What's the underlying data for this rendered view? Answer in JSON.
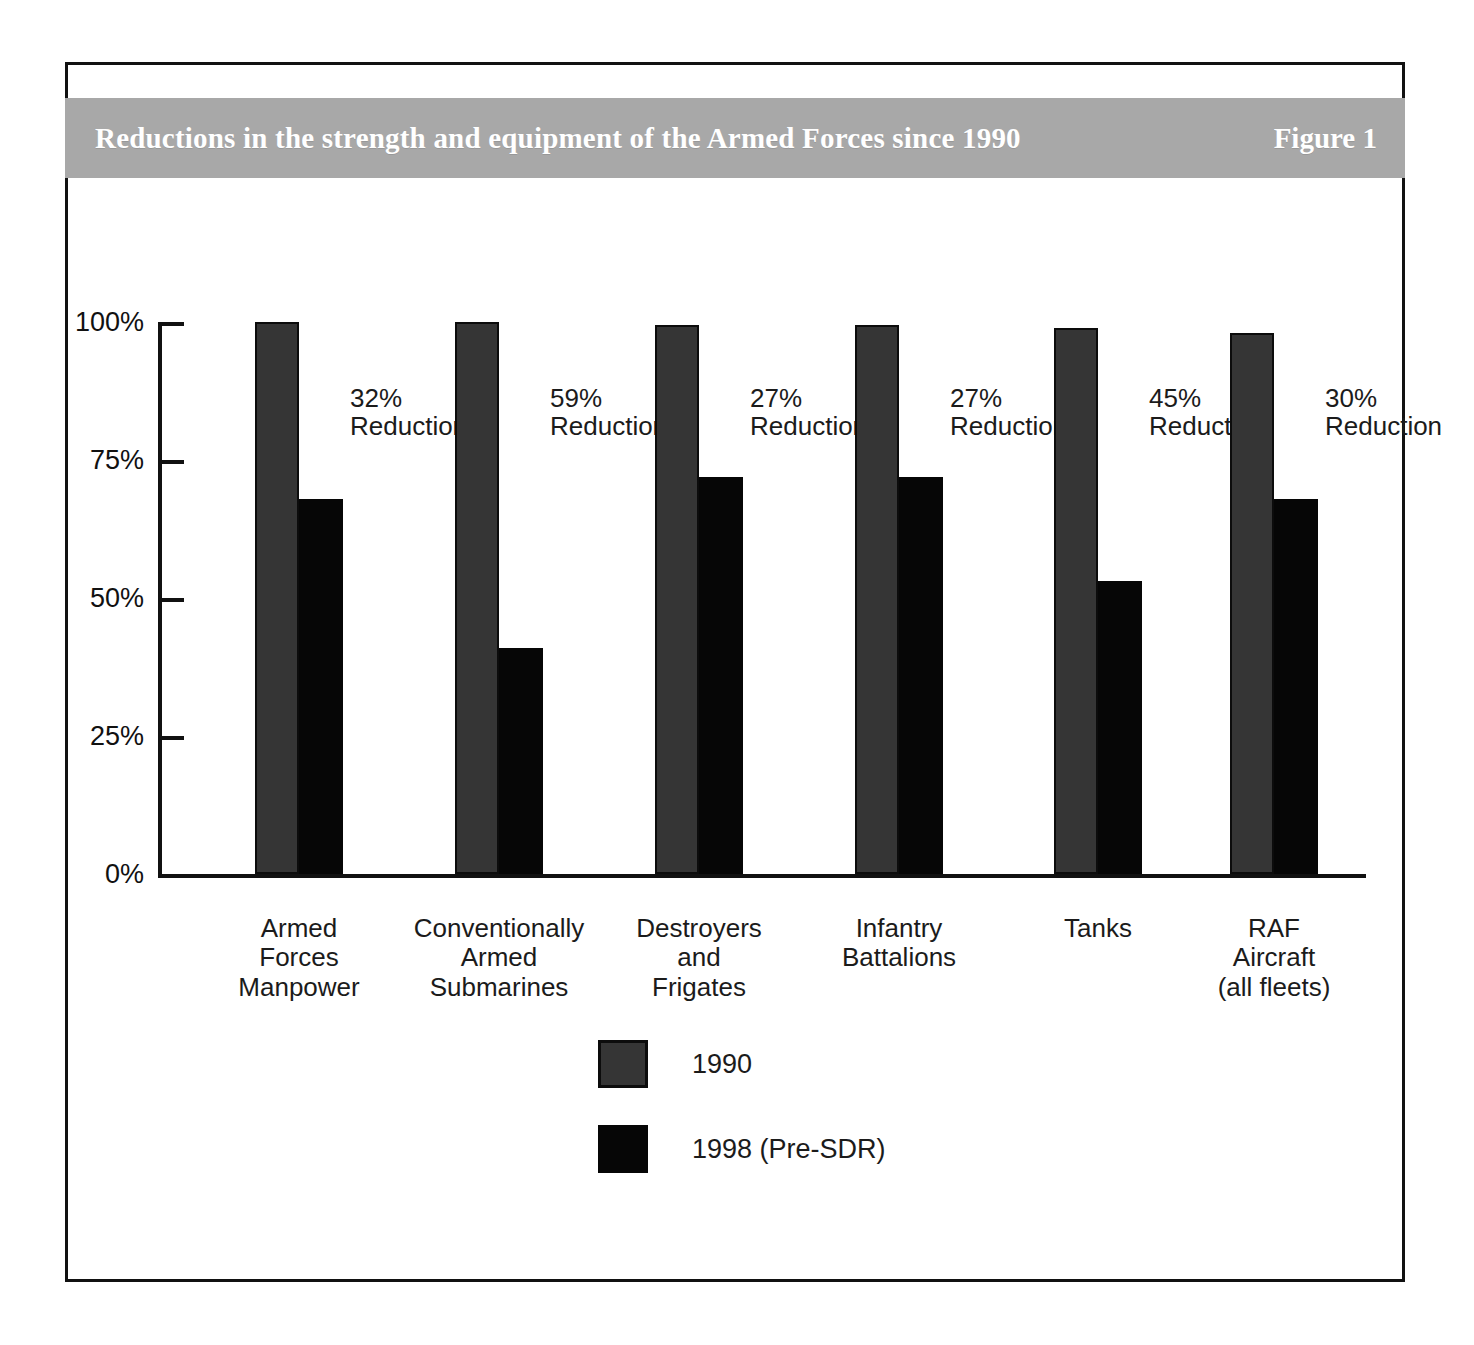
{
  "figure": {
    "title": "Reductions in the strength and equipment of the Armed Forces since 1990",
    "figure_label": "Figure 1",
    "band_color": "#a8a8a8",
    "frame_color": "#111111"
  },
  "chart_data": {
    "type": "bar",
    "title": "Reductions in the strength and equipment of the Armed Forces since 1990",
    "xlabel": "",
    "ylabel": "",
    "ylim": [
      0,
      100
    ],
    "ytick_labels": [
      "100%",
      "75%",
      "50%",
      "25%",
      "0%"
    ],
    "ytick_values": [
      100,
      75,
      50,
      25,
      0
    ],
    "grid": false,
    "legend_position": "bottom-center",
    "categories": [
      "Armed\nForces\nManpower",
      "Conventionally\nArmed\nSubmarines",
      "Destroyers\nand\nFrigates",
      "Infantry\nBattalions",
      "Tanks",
      "RAF\nAircraft\n(all fleets)"
    ],
    "series": [
      {
        "name": "1990",
        "color": "#353535",
        "values": [
          100,
          100,
          99.5,
          99.5,
          99,
          98
        ]
      },
      {
        "name": "1998 (Pre-SDR)",
        "color": "#060606",
        "values": [
          68,
          41,
          72,
          72,
          53,
          68
        ]
      }
    ],
    "annotations": [
      "32%",
      "59%",
      "27%",
      "27%",
      "45%",
      "30%"
    ],
    "annotation_suffix": "Reduction"
  },
  "categories_display": [
    {
      "line1": "Armed",
      "line2": "Forces",
      "line3": "Manpower"
    },
    {
      "line1": "Conventionally",
      "line2": "Armed",
      "line3": "Submarines"
    },
    {
      "line1": "Destroyers",
      "line2": "and",
      "line3": "Frigates"
    },
    {
      "line1": "Infantry",
      "line2": "Battalions",
      "line3": ""
    },
    {
      "line1": "Tanks",
      "line2": "",
      "line3": ""
    },
    {
      "line1": "RAF",
      "line2": "Aircraft",
      "line3": "(all fleets)"
    }
  ],
  "reduction_labels": [
    {
      "pct": "32%",
      "word": "Reduction"
    },
    {
      "pct": "59%",
      "word": "Reduction"
    },
    {
      "pct": "27%",
      "word": "Reduction"
    },
    {
      "pct": "27%",
      "word": "Reduction"
    },
    {
      "pct": "45%",
      "word": "Reduction"
    },
    {
      "pct": "30%",
      "word": "Reduction"
    }
  ],
  "yticks": [
    {
      "label": "100%",
      "value": 100
    },
    {
      "label": "75%",
      "value": 75
    },
    {
      "label": "50%",
      "value": 50
    },
    {
      "label": "25%",
      "value": 25
    },
    {
      "label": "0%",
      "value": 0
    }
  ],
  "legend": [
    {
      "label": "1990",
      "swatch": "#353535"
    },
    {
      "label": "1998 (Pre-SDR)",
      "swatch": "#060606"
    }
  ]
}
